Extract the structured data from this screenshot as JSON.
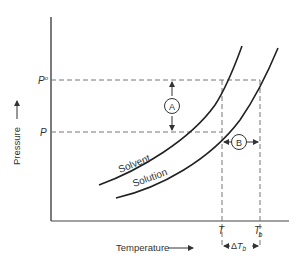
{
  "diagram": {
    "type": "phase-diagram",
    "axes": {
      "x_label": "Temperature",
      "y_label": "Pressure",
      "x_arrow": "→",
      "y_arrow": "→"
    },
    "y_ticks": [
      {
        "label": "P°",
        "base": "P",
        "sup": "o"
      },
      {
        "label": "P",
        "base": "P",
        "sup": ""
      }
    ],
    "x_ticks": [
      {
        "label": "T",
        "base": "T",
        "sub": ""
      },
      {
        "label": "T′b",
        "base": "T",
        "prime": "′",
        "sub": "b"
      }
    ],
    "curves": [
      {
        "name": "Solvent",
        "label": "Solvent"
      },
      {
        "name": "Solution",
        "label": "Solution"
      }
    ],
    "annotations": {
      "a": {
        "label": "A",
        "meaning": "vertical gap between P° and P"
      },
      "b": {
        "label": "B",
        "meaning": "horizontal gap between T and T′b"
      },
      "delta": {
        "label": "ΔT",
        "sub": "b",
        "symbol": "Δ",
        "base": "T"
      }
    },
    "colors": {
      "line": "#333333",
      "dashed": "#777777",
      "background": "#ffffff"
    }
  }
}
